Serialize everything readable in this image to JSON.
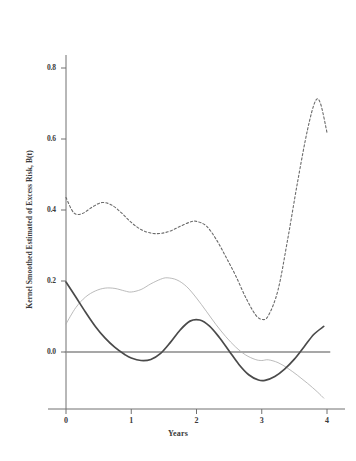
{
  "chart_data": {
    "type": "line",
    "title": "",
    "xlabel": "Years",
    "ylabel": "Kernel Smoothed Estimated of Excess Risk, B(t)",
    "xlim": [
      -0.08,
      4.12
    ],
    "ylim": [
      -0.1,
      0.9
    ],
    "grid": false,
    "legend": "none",
    "xticks": [
      "0",
      "1",
      "2",
      "3",
      "4"
    ],
    "xtick_values": [
      0,
      1,
      2,
      3,
      4
    ],
    "yticks": [
      "0.0",
      "0.2",
      "0.4",
      "0.6",
      "0.8"
    ],
    "ytick_values": [
      0.0,
      0.2,
      0.4,
      0.6,
      0.8
    ],
    "reference_line": {
      "name": "zero-line",
      "y": 0.0,
      "style": "solid",
      "color": "#8a8a8a"
    },
    "series": [
      {
        "name": "upper-dashed-curve",
        "style": "dashed",
        "color": "#6b6b6b",
        "width": 1.1,
        "x": [
          0.0,
          0.12,
          0.25,
          0.4,
          0.55,
          0.7,
          0.85,
          1.0,
          1.15,
          1.3,
          1.45,
          1.6,
          1.75,
          1.9,
          2.0,
          2.15,
          2.3,
          2.45,
          2.6,
          2.75,
          2.9,
          3.0,
          3.1,
          3.25,
          3.4,
          3.55,
          3.7,
          3.82,
          3.9,
          4.0
        ],
        "y": [
          0.435,
          0.392,
          0.39,
          0.408,
          0.421,
          0.414,
          0.392,
          0.365,
          0.345,
          0.335,
          0.334,
          0.341,
          0.354,
          0.366,
          0.368,
          0.355,
          0.318,
          0.268,
          0.215,
          0.155,
          0.106,
          0.092,
          0.102,
          0.175,
          0.32,
          0.48,
          0.625,
          0.706,
          0.7,
          0.618
        ]
      },
      {
        "name": "middle-thin-curve",
        "style": "solid-thin",
        "color": "#a9a9a9",
        "width": 0.8,
        "x": [
          0.0,
          0.15,
          0.3,
          0.45,
          0.6,
          0.75,
          0.9,
          1.0,
          1.15,
          1.3,
          1.45,
          1.55,
          1.7,
          1.85,
          2.0,
          2.15,
          2.3,
          2.45,
          2.6,
          2.75,
          2.9,
          3.0,
          3.1,
          3.25,
          3.4,
          3.55,
          3.7,
          3.85,
          3.95
        ],
        "y": [
          0.079,
          0.125,
          0.155,
          0.172,
          0.18,
          0.179,
          0.172,
          0.169,
          0.176,
          0.192,
          0.205,
          0.209,
          0.203,
          0.184,
          0.152,
          0.115,
          0.077,
          0.043,
          0.014,
          -0.008,
          -0.021,
          -0.024,
          -0.022,
          -0.03,
          -0.046,
          -0.066,
          -0.088,
          -0.112,
          -0.13
        ]
      },
      {
        "name": "lower-bold-curve",
        "style": "solid-bold",
        "color": "#4a4a4a",
        "width": 1.7,
        "x": [
          0.0,
          0.15,
          0.3,
          0.45,
          0.6,
          0.75,
          0.9,
          1.0,
          1.15,
          1.3,
          1.45,
          1.6,
          1.75,
          1.9,
          2.05,
          2.2,
          2.35,
          2.5,
          2.65,
          2.8,
          2.95,
          3.05,
          3.2,
          3.35,
          3.5,
          3.65,
          3.8,
          3.95
        ],
        "y": [
          0.197,
          0.155,
          0.112,
          0.072,
          0.039,
          0.013,
          -0.007,
          -0.017,
          -0.024,
          -0.021,
          -0.004,
          0.027,
          0.062,
          0.087,
          0.09,
          0.073,
          0.041,
          0.003,
          -0.035,
          -0.064,
          -0.079,
          -0.08,
          -0.069,
          -0.048,
          -0.02,
          0.015,
          0.05,
          0.072
        ]
      }
    ]
  },
  "axis": {
    "x_title": "Years",
    "y_title": "Kernel Smoothed Estimated of Excess Risk, B(t)"
  }
}
